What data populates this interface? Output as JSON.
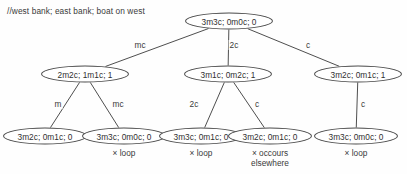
{
  "diagram": {
    "comment": "//west bank; east bank; boat on west",
    "ink_color": "#3a3a3a",
    "background_color": "#fefefe",
    "nodes": [
      {
        "id": "root",
        "label": "3m3c; 0m0c; 0",
        "cx": 229,
        "cy": 21,
        "w": 88,
        "h": 17,
        "annotation": ""
      },
      {
        "id": "m1",
        "label": "2m2c; 1m1c; 1",
        "cx": 85,
        "cy": 74,
        "w": 88,
        "h": 17,
        "annotation": ""
      },
      {
        "id": "m2",
        "label": "3m1c; 0m2c; 1",
        "cx": 228,
        "cy": 74,
        "w": 88,
        "h": 17,
        "annotation": ""
      },
      {
        "id": "m3",
        "label": "3m2c; 0m1c; 1",
        "cx": 358,
        "cy": 74,
        "w": 88,
        "h": 17,
        "annotation": ""
      },
      {
        "id": "b1",
        "label": "3m2c; 0m1c; 0",
        "cx": 45,
        "cy": 136,
        "w": 84,
        "h": 17,
        "annotation": ""
      },
      {
        "id": "b2",
        "label": "3m3c; 0m0c; 0",
        "cx": 124,
        "cy": 136,
        "w": 84,
        "h": 17,
        "annotation": "× loop"
      },
      {
        "id": "b3",
        "label": "3m3c; 0m1c; 0",
        "cx": 201,
        "cy": 136,
        "w": 84,
        "h": 17,
        "annotation": "× loop"
      },
      {
        "id": "b4",
        "label": "3m2c; 0m1c; 0",
        "cx": 270,
        "cy": 136,
        "w": 84,
        "h": 17,
        "annotation": "× occours\nelsewhere"
      },
      {
        "id": "b5",
        "label": "3m3c; 0m0c; 0",
        "cx": 356,
        "cy": 136,
        "w": 84,
        "h": 17,
        "annotation": "× loop"
      }
    ],
    "edges": [
      {
        "from": "root",
        "to": "m1",
        "label": "mc",
        "lx": 140,
        "ly": 45
      },
      {
        "from": "root",
        "to": "m2",
        "label": "2c",
        "lx": 234,
        "ly": 45
      },
      {
        "from": "root",
        "to": "m3",
        "label": "c",
        "lx": 308,
        "ly": 45
      },
      {
        "from": "m1",
        "to": "b1",
        "label": "m",
        "lx": 58,
        "ly": 104
      },
      {
        "from": "m1",
        "to": "b2",
        "label": "mc",
        "lx": 118,
        "ly": 104
      },
      {
        "from": "m2",
        "to": "b3",
        "label": "2c",
        "lx": 194,
        "ly": 104
      },
      {
        "from": "m2",
        "to": "b4",
        "label": "c",
        "lx": 257,
        "ly": 104
      },
      {
        "from": "m3",
        "to": "b5",
        "label": "c",
        "lx": 363,
        "ly": 104
      }
    ]
  }
}
